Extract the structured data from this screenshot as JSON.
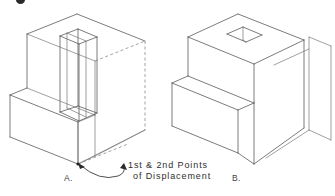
{
  "figure": {
    "background_color": "#ffffff",
    "line_color": "#5a5a5a",
    "hidden_line_color": "#8a8a8a",
    "annotation_color": "#2e2e2e",
    "label_a": "A.",
    "label_b": "B.",
    "callout": {
      "line1": "1st  &  2nd  Points",
      "line2": "of  Displacement"
    }
  }
}
